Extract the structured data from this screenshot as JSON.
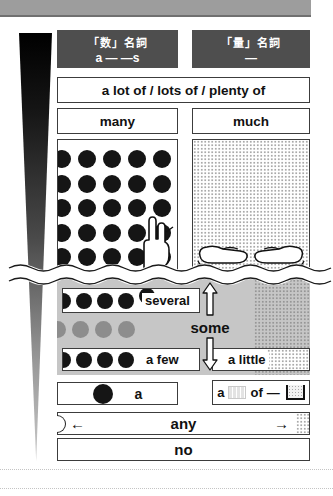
{
  "headers": {
    "countable": {
      "title": "「数」名詞",
      "pattern": "a ―  ―s"
    },
    "uncountable": {
      "title": "「量」名詞",
      "pattern": "―"
    }
  },
  "shared": {
    "a_lot": "a lot of / lots of / plenty of"
  },
  "columns": {
    "many": "many",
    "much": "much"
  },
  "grid": {
    "dots": 25
  },
  "zone": {
    "several": {
      "dots": 4,
      "label": "several"
    },
    "gray_row": {
      "dots": 4
    },
    "a_few": {
      "dots": 4,
      "label": "a few"
    },
    "a_little": {
      "label": "a little"
    },
    "some_label": "some"
  },
  "bottom": {
    "a_label": "a",
    "unit_phrase": {
      "a": "a",
      "of": "of",
      "dash": "―"
    },
    "any": "any",
    "no": "no"
  },
  "icons": {
    "left_arrow": "←",
    "right_arrow": "→"
  },
  "colors": {
    "header_bg": "#4e4e4e",
    "top_band": "#9d9d9d",
    "zone_gray": "#c6c6c6",
    "dot_black": "#151515",
    "dot_gray": "#8d8d8d"
  }
}
